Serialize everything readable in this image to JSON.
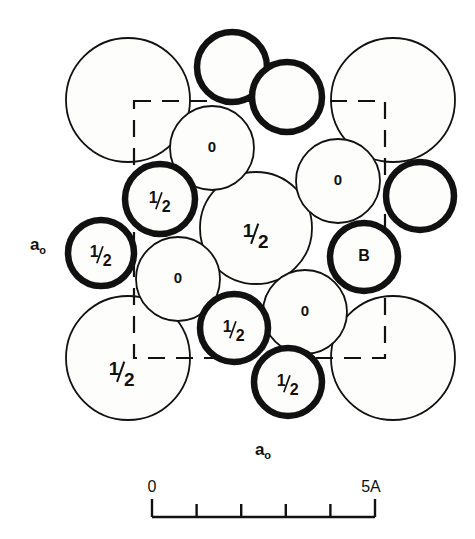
{
  "figure": {
    "background_color": "#ffffff",
    "ink_color": "#111111",
    "fill_color": "#fdfdfb",
    "width": 475,
    "height": 539
  },
  "axes": {
    "left_label": "a₀",
    "bottom_label": "a₀",
    "left_label_text": "ao",
    "bottom_label_text": "ao"
  },
  "unit_cell": {
    "style": "dashed",
    "left": 134,
    "top": 101,
    "right": 385,
    "bottom": 358,
    "dash_pattern": "17 11",
    "stroke_width": 2.2
  },
  "scale_bar": {
    "start_label": "0",
    "end_label": "5A",
    "x_start": 152,
    "x_end": 375,
    "y": 517,
    "tick_count": 6,
    "divisions": 5,
    "units": "Angstrom",
    "tick_height": 13,
    "stroke_width": 2.4
  },
  "atoms": [
    {
      "id": "a1",
      "label": "",
      "cx": 128,
      "cy": 100,
      "r": 62,
      "weight": "thin",
      "font": 0,
      "name": "atom-large-top-left"
    },
    {
      "id": "a2",
      "label": "",
      "cx": 393,
      "cy": 100,
      "r": 62,
      "weight": "thin",
      "font": 0,
      "name": "atom-large-top-right"
    },
    {
      "id": "a3",
      "label": "½",
      "cx": 128,
      "cy": 358,
      "r": 62,
      "weight": "thin",
      "font": 19,
      "name": "atom-large-bottom-left",
      "label_dx": -6,
      "label_dy": 14
    },
    {
      "id": "a4",
      "label": "",
      "cx": 393,
      "cy": 358,
      "r": 62,
      "weight": "thin",
      "font": 0,
      "name": "atom-large-bottom-right"
    },
    {
      "id": "a5",
      "label": "½",
      "cx": 256,
      "cy": 228,
      "r": 56,
      "weight": "thin",
      "font": 19,
      "name": "atom-center-half",
      "label_dx": 0,
      "label_dy": 6
    },
    {
      "id": "a6",
      "label": "0",
      "cx": 212,
      "cy": 148,
      "r": 42,
      "weight": "thin",
      "font": 15,
      "name": "atom-zero-upper-left",
      "label_dx": 0,
      "label_dy": 0
    },
    {
      "id": "a7",
      "label": "0",
      "cx": 338,
      "cy": 181,
      "r": 42,
      "weight": "thin",
      "font": 15,
      "name": "atom-zero-upper-right",
      "label_dx": 0,
      "label_dy": 0
    },
    {
      "id": "a8",
      "label": "0",
      "cx": 178,
      "cy": 279,
      "r": 42,
      "weight": "thin",
      "font": 15,
      "name": "atom-zero-lower-left",
      "label_dx": 0,
      "label_dy": 0
    },
    {
      "id": "a9",
      "label": "0",
      "cx": 305,
      "cy": 312,
      "r": 42,
      "weight": "thin",
      "font": 15,
      "name": "atom-zero-lower-right",
      "label_dx": 0,
      "label_dy": 0
    },
    {
      "id": "a10",
      "label": "",
      "cx": 232,
      "cy": 67,
      "r": 35,
      "weight": "bold",
      "font": 0,
      "name": "atom-bold-top-upper"
    },
    {
      "id": "a11",
      "label": "",
      "cx": 287,
      "cy": 97,
      "r": 35,
      "weight": "bold",
      "font": 0,
      "name": "atom-bold-top-lower"
    },
    {
      "id": "a12",
      "label": "½",
      "cx": 160,
      "cy": 199,
      "r": 35,
      "weight": "bold",
      "font": 16,
      "name": "atom-bold-half-upper-left",
      "label_dx": 0,
      "label_dy": 2
    },
    {
      "id": "a13",
      "label": "½",
      "cx": 101,
      "cy": 253,
      "r": 33,
      "weight": "bold",
      "font": 16,
      "name": "atom-bold-half-left",
      "label_dx": 0,
      "label_dy": 2
    },
    {
      "id": "a14",
      "label": "B",
      "cx": 364,
      "cy": 257,
      "r": 34,
      "weight": "bold",
      "font": 16,
      "name": "atom-bold-b-right",
      "label_dx": 0,
      "label_dy": 0
    },
    {
      "id": "a15",
      "label": "",
      "cx": 420,
      "cy": 196,
      "r": 34,
      "weight": "bold",
      "font": 0,
      "name": "atom-bold-right-edge"
    },
    {
      "id": "a16",
      "label": "½",
      "cx": 234,
      "cy": 328,
      "r": 34,
      "weight": "bold",
      "font": 16,
      "name": "atom-bold-half-bottom-inner",
      "label_dx": 0,
      "label_dy": 2
    },
    {
      "id": "a17",
      "label": "½",
      "cx": 288,
      "cy": 382,
      "r": 34,
      "weight": "bold",
      "font": 16,
      "name": "atom-bold-half-bottom-outer",
      "label_dx": 0,
      "label_dy": 2
    }
  ],
  "legend_notes": {
    "height_labels": [
      "0",
      "½"
    ],
    "special_site_label": "B"
  }
}
